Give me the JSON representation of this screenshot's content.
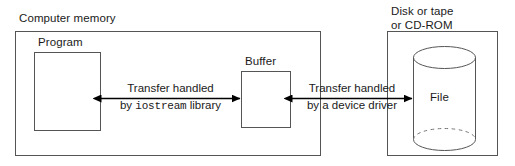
{
  "diagram": {
    "type": "block-diagram",
    "title_visible": false,
    "colors": {
      "stroke": "#555555",
      "text": "#1a1a1a",
      "background": "#ffffff",
      "arrow": "#000000"
    },
    "containers": [
      {
        "id": "computer-memory",
        "label": "Computer memory",
        "label_position": "above-left"
      },
      {
        "id": "storage-device",
        "label": "Disk or tape\nor CD-ROM",
        "label_line1": "Disk or tape",
        "label_line2": "or CD-ROM",
        "label_position": "above-left"
      }
    ],
    "boxes": [
      {
        "id": "program",
        "label": "Program"
      },
      {
        "id": "buffer",
        "label": "Buffer"
      }
    ],
    "cylinders": [
      {
        "id": "file",
        "label": "File"
      }
    ],
    "arrows": [
      {
        "id": "iostream-transfer",
        "direction": "bidirectional",
        "from": "program",
        "to": "buffer",
        "label_line1": "Transfer handled",
        "label_line2_prefix": "by ",
        "label_line2_code": "iostream",
        "label_line2_suffix": " library"
      },
      {
        "id": "device-driver-transfer",
        "direction": "bidirectional",
        "from": "buffer",
        "to": "file",
        "label_line1": "Transfer handled",
        "label_line2": "by a device driver"
      }
    ]
  }
}
